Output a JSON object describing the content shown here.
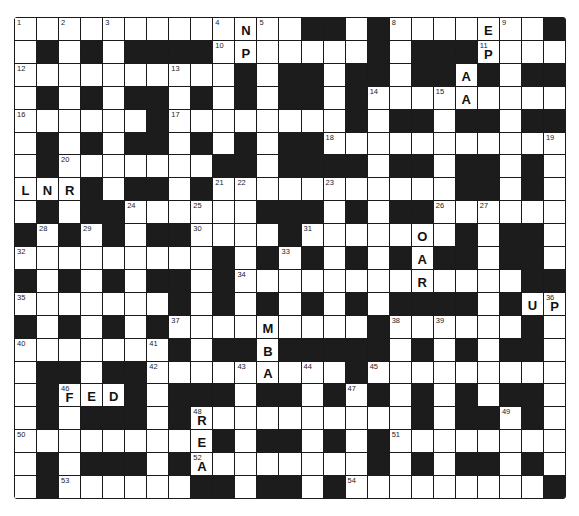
{
  "puzzle": {
    "type": "crossword",
    "rows": 21,
    "cols": 25,
    "grid": [
      ".............##.#.......##",
      ".#.#.####.......#.###....",
      "..........#.##.##.##.#.##",
      ".#.#.##.#.#.##.#.........",
      "......#........#.##.##.##",
      ".#.#.##.#.#.##...........",
      ".#.......##.####.##.##.#.",
      "...#.##.#...........##.#.",
      ".#.##......###.#.##......",
      "#.#.#.##....#.......#.##.",
      ".........#.#.#.#.#.##.##.",
      "#.#.#.##.#.............##",
      ".......#.#.#.#.#.####.#..",
      "#.#.#.#.........#......#.",
      ".......#.##.#####.#.#.##.",
      ".##.##.........#.........",
      ".#...#.###.##.#.#.#.#.##.",
      ".#.###.#..........#.##.#.",
      ".........#.##.#.#........",
      ".#.###.#........#.#.##.#.",
      ".#......##.##.#.........#"
    ],
    "numbers": [
      {
        "n": "1",
        "r": 0,
        "c": 0
      },
      {
        "n": "2",
        "r": 0,
        "c": 2
      },
      {
        "n": "3",
        "r": 0,
        "c": 4
      },
      {
        "n": "4",
        "r": 0,
        "c": 9
      },
      {
        "n": "5",
        "r": 0,
        "c": 11
      },
      {
        "n": "6",
        "r": 0,
        "c": 14
      },
      {
        "n": "7",
        "r": 0,
        "c": 16
      },
      {
        "n": "8",
        "r": 0,
        "c": 17
      },
      {
        "n": "9",
        "r": 0,
        "c": 22
      },
      {
        "n": "10",
        "r": 1,
        "c": 9
      },
      {
        "n": "11",
        "r": 1,
        "c": 21
      },
      {
        "n": "12",
        "r": 2,
        "c": 0
      },
      {
        "n": "13",
        "r": 2,
        "c": 7
      },
      {
        "n": "14",
        "r": 3,
        "c": 16
      },
      {
        "n": "15",
        "r": 3,
        "c": 19
      },
      {
        "n": "16",
        "r": 4,
        "c": 0
      },
      {
        "n": "17",
        "r": 4,
        "c": 7
      },
      {
        "n": "18",
        "r": 5,
        "c": 14
      },
      {
        "n": "19",
        "r": 5,
        "c": 24
      },
      {
        "n": "20",
        "r": 6,
        "c": 2
      },
      {
        "n": "21",
        "r": 7,
        "c": 9
      },
      {
        "n": "22",
        "r": 7,
        "c": 10
      },
      {
        "n": "23",
        "r": 7,
        "c": 14
      },
      {
        "n": "24",
        "r": 8,
        "c": 5
      },
      {
        "n": "25",
        "r": 8,
        "c": 8
      },
      {
        "n": "26",
        "r": 8,
        "c": 19
      },
      {
        "n": "27",
        "r": 8,
        "c": 21
      },
      {
        "n": "28",
        "r": 9,
        "c": 1
      },
      {
        "n": "29",
        "r": 9,
        "c": 3
      },
      {
        "n": "30",
        "r": 9,
        "c": 8
      },
      {
        "n": "31",
        "r": 9,
        "c": 13
      },
      {
        "n": "32",
        "r": 10,
        "c": 0
      },
      {
        "n": "33",
        "r": 10,
        "c": 12
      },
      {
        "n": "34",
        "r": 11,
        "c": 10
      },
      {
        "n": "35",
        "r": 12,
        "c": 0
      },
      {
        "n": "36",
        "r": 12,
        "c": 24
      },
      {
        "n": "37",
        "r": 13,
        "c": 7
      },
      {
        "n": "38",
        "r": 13,
        "c": 17
      },
      {
        "n": "39",
        "r": 13,
        "c": 19
      },
      {
        "n": "40",
        "r": 14,
        "c": 0
      },
      {
        "n": "41",
        "r": 14,
        "c": 6
      },
      {
        "n": "42",
        "r": 15,
        "c": 6
      },
      {
        "n": "43",
        "r": 15,
        "c": 10
      },
      {
        "n": "44",
        "r": 15,
        "c": 13
      },
      {
        "n": "45",
        "r": 15,
        "c": 16
      },
      {
        "n": "46",
        "r": 16,
        "c": 2
      },
      {
        "n": "47",
        "r": 16,
        "c": 15
      },
      {
        "n": "48",
        "r": 17,
        "c": 8
      },
      {
        "n": "49",
        "r": 17,
        "c": 22
      },
      {
        "n": "50",
        "r": 18,
        "c": 0
      },
      {
        "n": "51",
        "r": 18,
        "c": 17
      },
      {
        "n": "52",
        "r": 19,
        "c": 8
      },
      {
        "n": "53",
        "r": 20,
        "c": 2
      },
      {
        "n": "54",
        "r": 20,
        "c": 15
      }
    ],
    "letters": [
      {
        "ch": "N",
        "r": 0,
        "c": 10
      },
      {
        "ch": "E",
        "r": 0,
        "c": 21
      },
      {
        "ch": "P",
        "r": 1,
        "c": 10
      },
      {
        "ch": "P",
        "r": 1,
        "c": 21
      },
      {
        "ch": "A",
        "r": 2,
        "c": 20
      },
      {
        "ch": "A",
        "r": 3,
        "c": 20
      },
      {
        "ch": "L",
        "r": 7,
        "c": 0
      },
      {
        "ch": "N",
        "r": 7,
        "c": 1
      },
      {
        "ch": "R",
        "r": 7,
        "c": 2
      },
      {
        "ch": "O",
        "r": 9,
        "c": 18
      },
      {
        "ch": "A",
        "r": 10,
        "c": 18
      },
      {
        "ch": "R",
        "r": 11,
        "c": 18
      },
      {
        "ch": "U",
        "r": 12,
        "c": 23
      },
      {
        "ch": "P",
        "r": 12,
        "c": 24
      },
      {
        "ch": "M",
        "r": 13,
        "c": 11
      },
      {
        "ch": "B",
        "r": 14,
        "c": 11
      },
      {
        "ch": "A",
        "r": 15,
        "c": 11
      },
      {
        "ch": "F",
        "r": 16,
        "c": 2
      },
      {
        "ch": "E",
        "r": 16,
        "c": 3
      },
      {
        "ch": "D",
        "r": 16,
        "c": 4
      },
      {
        "ch": "R",
        "r": 17,
        "c": 8
      },
      {
        "ch": "E",
        "r": 18,
        "c": 8
      },
      {
        "ch": "A",
        "r": 19,
        "c": 8
      }
    ],
    "colors": {
      "block": "#1c1c1c",
      "cell": "#ffffff",
      "text": "#111111"
    }
  }
}
